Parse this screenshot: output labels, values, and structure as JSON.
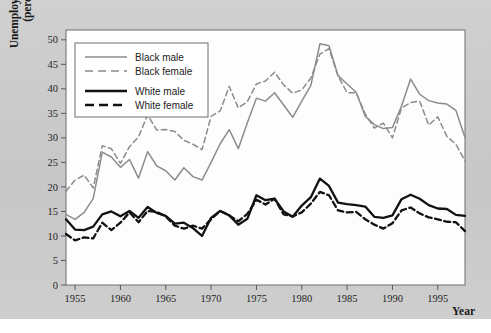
{
  "chart_data": {
    "type": "line",
    "title": "",
    "xlabel": "Year",
    "ylabel": "Unemployment rate (percent)",
    "xlim": [
      1954,
      1998
    ],
    "ylim": [
      0,
      52
    ],
    "yticks": [
      0,
      5,
      10,
      15,
      20,
      25,
      30,
      35,
      40,
      45,
      50
    ],
    "xticks": [
      1955,
      1960,
      1965,
      1970,
      1975,
      1980,
      1985,
      1990,
      1995
    ],
    "grid": false,
    "legend_position": "top-left",
    "x": [
      1954,
      1955,
      1956,
      1957,
      1958,
      1959,
      1960,
      1961,
      1962,
      1963,
      1964,
      1965,
      1966,
      1967,
      1968,
      1969,
      1970,
      1971,
      1972,
      1973,
      1974,
      1975,
      1976,
      1977,
      1978,
      1979,
      1980,
      1981,
      1982,
      1983,
      1984,
      1985,
      1986,
      1987,
      1988,
      1989,
      1990,
      1991,
      1992,
      1993,
      1994,
      1995,
      1996,
      1997,
      1998
    ],
    "series": [
      {
        "name": "Black male",
        "color": "#8c8c8c",
        "style": "solid",
        "values": [
          14.4,
          13.4,
          14.8,
          17.6,
          27.1,
          26.1,
          24.0,
          25.6,
          21.8,
          27.2,
          24.3,
          23.3,
          21.4,
          23.9,
          22.1,
          21.4,
          25.0,
          28.8,
          31.7,
          27.8,
          33.1,
          38.1,
          37.5,
          39.2,
          36.7,
          34.2,
          37.5,
          40.7,
          49.2,
          48.8,
          42.7,
          41.0,
          39.3,
          34.4,
          32.7,
          31.9,
          32.1,
          36.5,
          42.0,
          38.9,
          37.6,
          37.1,
          36.9,
          35.6,
          30.1
        ]
      },
      {
        "name": "Black female",
        "color": "#8c8c8c",
        "style": "dashed",
        "values": [
          19.1,
          21.4,
          22.4,
          19.8,
          28.4,
          27.8,
          24.8,
          28.2,
          30.2,
          34.7,
          31.6,
          31.7,
          31.3,
          29.5,
          28.7,
          27.6,
          34.4,
          35.5,
          40.5,
          36.1,
          37.4,
          41.0,
          41.6,
          43.4,
          40.8,
          39.1,
          39.8,
          42.2,
          47.1,
          48.2,
          42.6,
          39.2,
          39.2,
          34.9,
          32.0,
          33.0,
          30.0,
          36.1,
          37.2,
          37.5,
          32.6,
          34.3,
          30.3,
          28.7,
          25.3
        ]
      },
      {
        "name": "White male",
        "color": "#111111",
        "style": "solid",
        "values": [
          13.4,
          11.3,
          11.2,
          11.9,
          14.4,
          15.0,
          14.0,
          15.1,
          13.7,
          15.9,
          14.7,
          14.1,
          12.5,
          12.7,
          11.6,
          10.0,
          13.7,
          15.1,
          14.2,
          12.3,
          13.5,
          18.3,
          17.3,
          17.6,
          15.0,
          13.9,
          16.2,
          17.9,
          21.7,
          20.2,
          16.8,
          16.5,
          16.3,
          16.0,
          13.9,
          13.7,
          14.2,
          17.5,
          18.4,
          17.6,
          16.3,
          15.6,
          15.5,
          14.3,
          14.1
        ]
      },
      {
        "name": "White female",
        "color": "#111111",
        "style": "dashed",
        "values": [
          10.4,
          9.1,
          9.7,
          9.5,
          12.7,
          11.2,
          12.7,
          14.8,
          12.8,
          15.1,
          14.9,
          14.0,
          12.1,
          11.5,
          12.1,
          11.5,
          13.4,
          15.1,
          14.2,
          13.0,
          14.5,
          17.4,
          16.4,
          17.6,
          14.4,
          14.0,
          14.8,
          16.6,
          19.0,
          18.3,
          15.2,
          14.8,
          14.9,
          13.4,
          12.3,
          11.5,
          12.6,
          15.2,
          15.8,
          14.6,
          13.8,
          13.4,
          12.9,
          12.8,
          11.0
        ]
      }
    ]
  },
  "legend": {
    "items": [
      {
        "label": "Black male",
        "color": "#8c8c8c",
        "style": "solid",
        "width": 1.5
      },
      {
        "label": "Black female",
        "color": "#8c8c8c",
        "style": "dashed",
        "width": 1.5
      },
      {
        "label": "White male",
        "color": "#111111",
        "style": "solid",
        "width": 2.4
      },
      {
        "label": "White female",
        "color": "#111111",
        "style": "dashed",
        "width": 2.4
      }
    ]
  },
  "axes": {
    "y_title": "Unemployment rate\n(percent)",
    "x_title": "Year"
  }
}
